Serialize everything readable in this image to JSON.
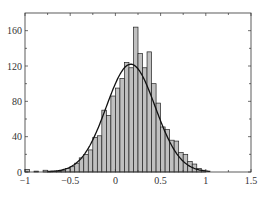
{
  "chart_data": {
    "type": "bar",
    "title": "",
    "xlabel": "",
    "ylabel": "",
    "xlim": [
      -1,
      1.5
    ],
    "ylim": [
      0,
      180
    ],
    "grid": false,
    "legend": null,
    "bin_width": 0.05,
    "x": [
      -1.0,
      -0.95,
      -0.9,
      -0.85,
      -0.8,
      -0.75,
      -0.7,
      -0.65,
      -0.6,
      -0.55,
      -0.5,
      -0.45,
      -0.4,
      -0.35,
      -0.3,
      -0.25,
      -0.2,
      -0.15,
      -0.1,
      -0.05,
      0.0,
      0.05,
      0.1,
      0.15,
      0.2,
      0.25,
      0.3,
      0.35,
      0.4,
      0.45,
      0.5,
      0.55,
      0.6,
      0.65,
      0.7,
      0.75,
      0.8,
      0.85,
      0.9,
      0.95
    ],
    "values": [
      3,
      0,
      1,
      0,
      2,
      1,
      1,
      1,
      2,
      4,
      6,
      10,
      16,
      20,
      25,
      39,
      41,
      70,
      64,
      86,
      95,
      106,
      124,
      118,
      164,
      134,
      118,
      136,
      100,
      78,
      51,
      48,
      36,
      35,
      22,
      20,
      12,
      9,
      4,
      2
    ],
    "fit_curve": {
      "type": "gaussian",
      "mean": 0.17,
      "std": 0.27,
      "peak": 122
    },
    "xticks": [
      "-1",
      "-0.5",
      "0",
      "0.5",
      "1",
      "1.5"
    ],
    "xtick_values": [
      -1,
      -0.5,
      0,
      0.5,
      1,
      1.5
    ],
    "yticks": [
      "0",
      "40",
      "80",
      "120",
      "160"
    ],
    "ytick_values": [
      0,
      40,
      80,
      120,
      160
    ],
    "bar_fill": "#c0c0c0",
    "bar_edge": "#222222",
    "curve_color": "#111111"
  }
}
